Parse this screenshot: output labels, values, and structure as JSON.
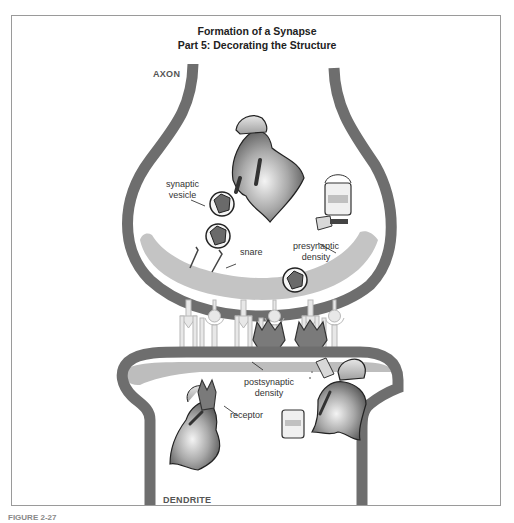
{
  "figure": {
    "title_line1": "Formation of a Synapse",
    "title_line2": "Part 5: Decorating the Structure",
    "caption_partial": "FIGURE 2-27"
  },
  "regions": {
    "axon": "AXON",
    "dendrite": "DENDRITE"
  },
  "labels": {
    "synaptic_vesicle_line1": "synaptic",
    "synaptic_vesicle_line2": "vesicle",
    "snare": "snare",
    "presynaptic_density_line1": "presynaptic",
    "presynaptic_density_line2": "density",
    "postsynaptic_density_line1": "postsynaptic",
    "postsynaptic_density_line2": "density",
    "receptor": "receptor"
  },
  "colors": {
    "membrane": "#6e6e6e",
    "density": "#bdbdbd",
    "frame": "#9a9a9a",
    "figure_fill": "#8a8a8a",
    "receptor": "#7a7a7a"
  },
  "icons": [
    "worker-figure-icon",
    "paint-can-icon",
    "paintbrush-icon",
    "vesicle-icon",
    "receptor-icon",
    "arrow-icon",
    "lollipop-receptor-icon"
  ]
}
